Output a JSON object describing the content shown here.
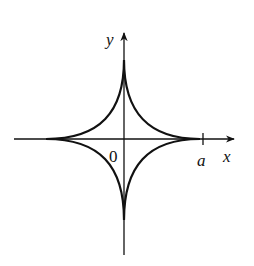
{
  "diagram": {
    "type": "astroid",
    "equation_hint": "x^(2/3) + y^(2/3) = a^(2/3)",
    "axes": {
      "x_label": "x",
      "y_label": "y",
      "origin_label": "0",
      "tick_label": "a"
    },
    "colors": {
      "stroke": "#111111",
      "background": "#ffffff"
    }
  }
}
